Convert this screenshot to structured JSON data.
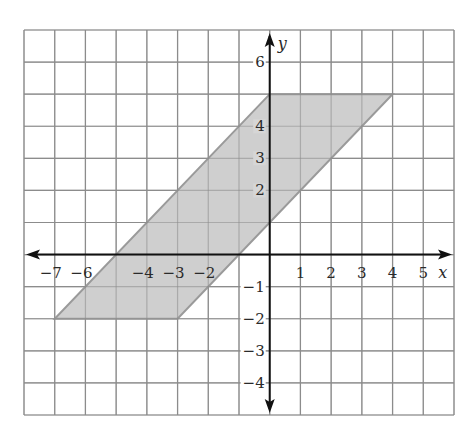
{
  "chart_data": {
    "type": "scatter",
    "title": "",
    "xlabel": "x",
    "ylabel": "y",
    "xlim": [
      -8,
      6
    ],
    "ylim": [
      -5,
      7
    ],
    "grid": true,
    "x_ticks": [
      -7,
      -6,
      -4,
      -3,
      -2,
      1,
      2,
      3,
      4,
      5
    ],
    "y_ticks": [
      6,
      4,
      3,
      2,
      -1,
      -2,
      -3,
      -4
    ],
    "shapes": [
      {
        "name": "parallelogram",
        "type": "polygon",
        "fill": "#cfcfcf",
        "stroke": "#9a9a9a",
        "vertices": [
          [
            0,
            5
          ],
          [
            4,
            5
          ],
          [
            -3,
            -2
          ],
          [
            -7,
            -2
          ]
        ]
      }
    ]
  },
  "labels": {
    "x_axis": "x",
    "y_axis": "y"
  },
  "colors": {
    "grid": "#8c8c8c",
    "axis": "#111111",
    "fill": "#cfcfcf",
    "edge": "#9a9a9a"
  }
}
